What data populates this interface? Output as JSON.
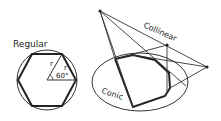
{
  "labels": {
    "regular": "Regular",
    "radius_left": "r",
    "radius_right": "r",
    "angle": "60°",
    "collinear": "Collinear",
    "conic": "Conic"
  },
  "colors": {
    "ink": "#222222",
    "background": "#ffffff"
  }
}
